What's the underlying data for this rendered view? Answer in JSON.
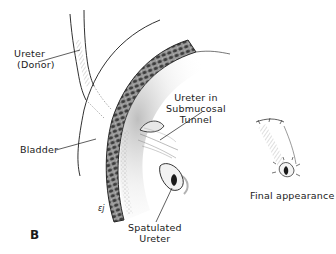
{
  "figure": {
    "panel_letter": "B",
    "signature": "ɛj",
    "colors": {
      "ink": "#1a1a1a",
      "background": "#ffffff",
      "shading": "#6a6a6a"
    }
  },
  "labels": {
    "ureter_donor": {
      "line1": "Ureter",
      "line2": "(Donor)"
    },
    "bladder": "Bladder",
    "ureter_tunnel": {
      "line1": "Ureter in",
      "line2": "Submucosal",
      "line3": "Tunnel"
    },
    "spatulated_ureter": {
      "line1": "Spatulated",
      "line2": "Ureter"
    },
    "final_appearance": "Final appearance"
  }
}
